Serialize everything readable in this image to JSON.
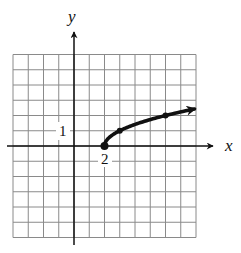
{
  "chart_data": {
    "type": "line",
    "title": "",
    "function": "y = sqrt(x - 2)",
    "xlabel": "x",
    "ylabel": "y",
    "xlim": [
      -4,
      8
    ],
    "ylim": [
      -6,
      6
    ],
    "grid": true,
    "grid_step": 1,
    "tick_labels": [
      {
        "axis": "y",
        "value": 1,
        "label": "1"
      },
      {
        "axis": "x",
        "value": 2,
        "label": "2"
      }
    ],
    "series": [
      {
        "name": "y = sqrt(x - 2)",
        "points": [
          [
            2,
            0
          ],
          [
            3,
            1
          ],
          [
            6,
            2
          ]
        ],
        "marked_points": [
          [
            2,
            0
          ],
          [
            3,
            1
          ],
          [
            6,
            2
          ]
        ],
        "start_closed": true,
        "end_arrow": true,
        "arrow_end": [
          7.9,
          2.45
        ]
      }
    ],
    "legend": null
  },
  "labels": {
    "x_axis": "x",
    "y_axis": "y",
    "y_tick": "1",
    "x_tick": "2"
  },
  "style": {
    "grid_color": "#8a8a8a",
    "axis_color": "#111111",
    "curve_color": "#111111",
    "background": "#ffffff"
  }
}
